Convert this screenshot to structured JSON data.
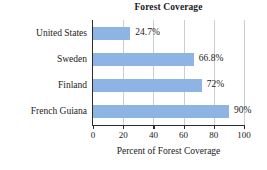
{
  "chart_data": {
    "type": "bar",
    "orientation": "horizontal",
    "title": "Forest Coverage",
    "xlabel": "Percent of Forest Coverage",
    "ylabel": "",
    "xlim": [
      0,
      100
    ],
    "xticks": [
      0,
      20,
      40,
      60,
      80,
      100
    ],
    "xtick_labels": [
      "0",
      "20",
      "40",
      "60",
      "80",
      "100"
    ],
    "grid": "vertical",
    "legend": "none",
    "bar_color": "#8db4e2",
    "categories": [
      "United States",
      "Sweden",
      "Finland",
      "French Guiana"
    ],
    "values": [
      24.7,
      66.8,
      72,
      90
    ],
    "data_labels": [
      "24.7%",
      "66.8%",
      "72%",
      "90%"
    ],
    "bars": [
      {
        "category": "United States",
        "value": 24.7,
        "label": "24.7%"
      },
      {
        "category": "Sweden",
        "value": 66.8,
        "label": "66.8%"
      },
      {
        "category": "Finland",
        "value": 72,
        "label": "72%"
      },
      {
        "category": "French Guiana",
        "value": 90,
        "label": "90%"
      }
    ]
  }
}
